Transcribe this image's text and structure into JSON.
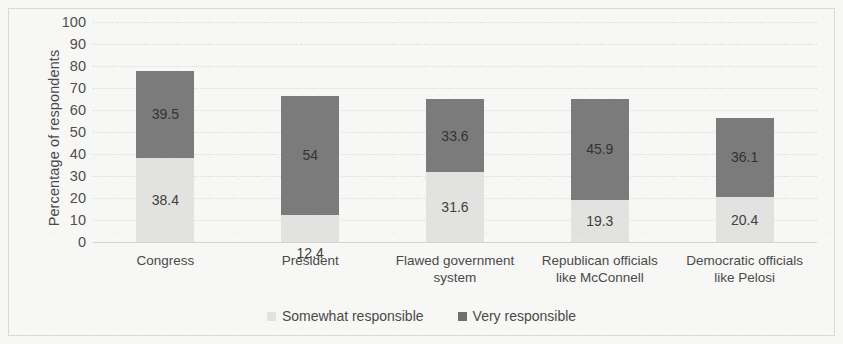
{
  "chart_data": {
    "type": "bar",
    "subtype": "stacked-column",
    "title": "",
    "xlabel": "",
    "ylabel": "Percentage of respondents",
    "ylim": [
      0,
      100
    ],
    "ytick_step": 10,
    "yticks": [
      100,
      90,
      80,
      70,
      60,
      50,
      40,
      30,
      20,
      10,
      0
    ],
    "grid": true,
    "grid_orientation": "horizontal",
    "legend_position": "bottom",
    "categories": [
      "Congress",
      "President",
      "Flawed government system",
      "Republican officials like McConnell",
      "Democratic officials like Pelosi"
    ],
    "category_lines": [
      [
        "Congress"
      ],
      [
        "President"
      ],
      [
        "Flawed government",
        "system"
      ],
      [
        "Republican officials",
        "like McConnell"
      ],
      [
        "Democratic officials",
        "like Pelosi"
      ]
    ],
    "series": [
      {
        "name": "Somewhat responsible",
        "color": "#e2e2e0",
        "values": [
          38.4,
          12.4,
          31.6,
          19.3,
          20.4
        ],
        "labels": [
          "38.4",
          "12.4",
          "31.6",
          "19.3",
          "20.4"
        ]
      },
      {
        "name": "Very responsible",
        "color": "#7b7b7b",
        "values": [
          39.5,
          54,
          33.6,
          45.9,
          36.1
        ],
        "labels": [
          "39.5",
          "54",
          "33.6",
          "45.9",
          "36.1"
        ]
      }
    ],
    "totals": [
      77.9,
      66.4,
      65.2,
      65.2,
      56.5
    ]
  },
  "legend": {
    "items": [
      {
        "label": "Somewhat responsible",
        "swatch": "somewhat"
      },
      {
        "label": "Very responsible",
        "swatch": "very"
      }
    ]
  },
  "colors": {
    "background": "#f7f7f5",
    "frame": "#d9d9d6",
    "gridline": "#dcdcd8",
    "text": "#4a4a4a",
    "series_somewhat": "#e2e2e0",
    "series_very": "#7b7b7b"
  }
}
